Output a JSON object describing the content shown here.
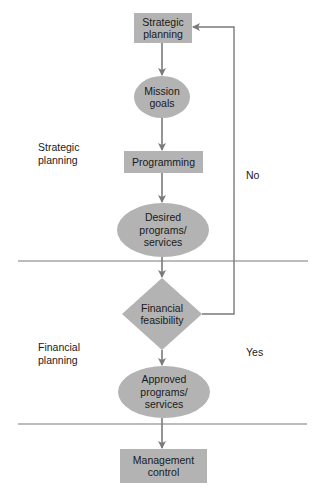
{
  "diagram": {
    "type": "flowchart",
    "colors": {
      "node_fill": "#b3b3b3",
      "line": "#7a7a7a",
      "background": "#ffffff",
      "text": "#1a1a1a"
    },
    "sections": [
      {
        "id": "strategic",
        "label": "Strategic\nplanning"
      },
      {
        "id": "financial",
        "label": "Financial\nplanning"
      }
    ],
    "nodes": [
      {
        "id": "strategic_planning",
        "shape": "rectangle",
        "label": "Strategic\nplanning"
      },
      {
        "id": "mission_goals",
        "shape": "ellipse",
        "label": "Mission\ngoals"
      },
      {
        "id": "programming",
        "shape": "rectangle",
        "label": "Programming"
      },
      {
        "id": "desired_programs",
        "shape": "ellipse",
        "label": "Desired\nprograms/\nservices"
      },
      {
        "id": "financial_feasibility",
        "shape": "diamond",
        "label": "Financial\nfeasibility"
      },
      {
        "id": "approved_programs",
        "shape": "ellipse",
        "label": "Approved\nprograms/\nservices"
      },
      {
        "id": "management_control",
        "shape": "rectangle",
        "label": "Management\ncontrol"
      }
    ],
    "edges": [
      {
        "from": "strategic_planning",
        "to": "mission_goals"
      },
      {
        "from": "mission_goals",
        "to": "programming"
      },
      {
        "from": "programming",
        "to": "desired_programs"
      },
      {
        "from": "desired_programs",
        "to": "financial_feasibility"
      },
      {
        "from": "financial_feasibility",
        "to": "approved_programs",
        "label": "Yes"
      },
      {
        "from": "financial_feasibility",
        "to": "strategic_planning",
        "label": "No"
      },
      {
        "from": "approved_programs",
        "to": "management_control"
      }
    ],
    "branch_labels": {
      "no": "No",
      "yes": "Yes"
    }
  }
}
